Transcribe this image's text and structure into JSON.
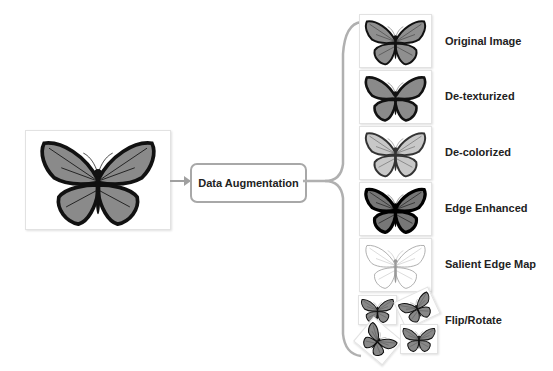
{
  "diagram": {
    "input": {
      "name": "input-butterfly-image",
      "icon": "butterfly-icon"
    },
    "process": {
      "label": "Data Augmentation"
    },
    "outputs": [
      {
        "label": "Original Image",
        "icon": "butterfly-original-icon"
      },
      {
        "label": "De-texturized",
        "icon": "butterfly-detexturized-icon"
      },
      {
        "label": "De-colorized",
        "icon": "butterfly-decolorized-icon"
      },
      {
        "label": "Edge Enhanced",
        "icon": "butterfly-edge-enhanced-icon"
      },
      {
        "label": "Salient Edge Map",
        "icon": "butterfly-edge-map-icon"
      },
      {
        "label": "Flip/Rotate",
        "icon": "butterfly-flip-rotate-icon"
      }
    ],
    "colors": {
      "wing": "#8a8a8a",
      "border": "#1a1a1a",
      "arrow": "#a0a0a0",
      "brace": "#b0b0b0"
    }
  }
}
